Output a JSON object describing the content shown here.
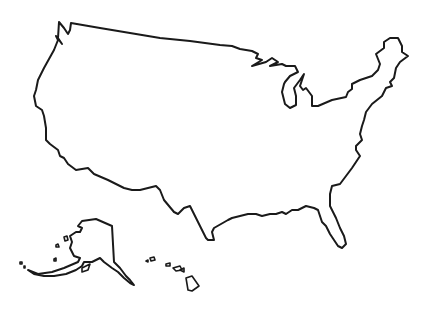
{
  "map": {
    "title": "United States outline map",
    "regions": [
      {
        "name": "Contiguous United States"
      },
      {
        "name": "Alaska"
      },
      {
        "name": "Hawaii"
      }
    ],
    "stroke_color": "#1a1a1a",
    "background_color": "#ffffff"
  }
}
